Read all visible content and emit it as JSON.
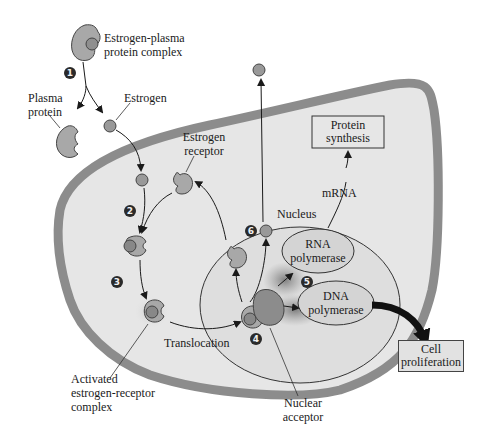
{
  "diagram": {
    "labels": {
      "estrogen_plasma_complex": "Estrogen-plasma\nprotein complex",
      "plasma_protein": "Plasma\nprotein",
      "estrogen": "Estrogen",
      "estrogen_receptor": "Estrogen\nreceptor",
      "nucleus": "Nucleus",
      "mrna": "mRNA",
      "rna_polymerase": "RNA\npolymerase",
      "dna_polymerase": "DNA\npolymerase",
      "translocation": "Translocation",
      "activated_complex": "Activated\nestrogen-receptor\ncomplex",
      "nuclear_acceptor": "Nuclear\nacceptor"
    },
    "boxes": {
      "protein_synthesis": "Protein\nsynthesis",
      "cell_proliferation": "Cell\nproliferation"
    },
    "steps": [
      "1",
      "2",
      "3",
      "4",
      "5",
      "6"
    ],
    "colors": {
      "cell_fill": "#e6e6e6",
      "membrane": "#8c8c8c",
      "nucleus_fill": "#dcdcdc",
      "molecule": "#9a9a9a",
      "polymerase_fill": "#d0d0d0",
      "glow": "#7a7a7a",
      "arrow": "#1a1a1a"
    }
  }
}
